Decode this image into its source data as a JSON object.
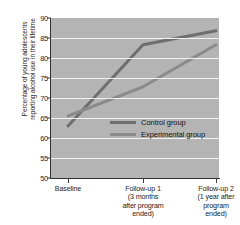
{
  "chart_data": {
    "type": "line",
    "title": "",
    "xlabel": "",
    "ylabel": "Percentage of young adolescents reporting alcohol use in their lifetime",
    "ylabel_line1": "Percentage of young adolescents",
    "ylabel_line2": "reporting alcohol use in their lifetime",
    "categories": [
      "Baseline",
      "Follow-up 1 (3 months after program ended)",
      "Follow-up 2 (1 year after program ended)"
    ],
    "x_tick_labels": [
      [
        "Baseline"
      ],
      [
        "Follow-up 1",
        "(3 months",
        "after program",
        "ended)"
      ],
      [
        "Follow-up 2",
        "(1 year after",
        "program",
        "ended)"
      ]
    ],
    "y_tick_labels": [
      "90",
      "85",
      "80",
      "75",
      "70",
      "65",
      "60",
      "55",
      "50"
    ],
    "y_ticks": [
      90,
      85,
      80,
      75,
      70,
      65,
      60,
      55,
      50
    ],
    "ylim": [
      50,
      90
    ],
    "grid": true,
    "grid_color": "#f2f2f2",
    "plot_background": "#b4b4b4",
    "legend_position": "center",
    "series": [
      {
        "name": "Control group",
        "values": [
          63.0,
          83.3,
          86.8
        ],
        "color": "#6e6e6e"
      },
      {
        "name": "Experimental group",
        "values": [
          65.5,
          72.8,
          83.3
        ],
        "color": "#8a8a8a"
      }
    ]
  },
  "legend": {
    "items": [
      {
        "label": "Control group",
        "color": "#6e6e6e"
      },
      {
        "label": "Experimental group",
        "color": "#8a8a8a"
      }
    ]
  }
}
